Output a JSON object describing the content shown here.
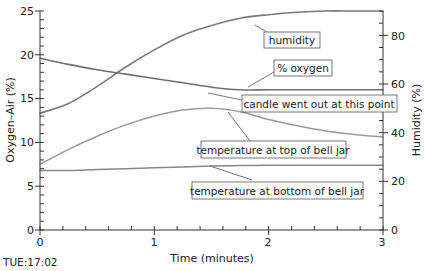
{
  "chart_data": {
    "type": "line",
    "title": "",
    "xlabel": "Time (minutes)",
    "ylabel": "Oxygen–Air (%)",
    "y2label": "Humidity (%)",
    "xlim": [
      0,
      3
    ],
    "ylim": [
      0,
      25
    ],
    "y2lim": [
      0,
      90
    ],
    "x_ticks": [
      "0",
      "1",
      "2",
      "3"
    ],
    "y_ticks": [
      "0",
      "5",
      "10",
      "15",
      "20",
      "25"
    ],
    "y2_ticks": [
      "0",
      "20",
      "40",
      "60",
      "80"
    ],
    "grid": false,
    "legend": "none (inline callout annotations)",
    "x": [
      0,
      0.25,
      0.5,
      0.75,
      1.0,
      1.25,
      1.5,
      1.75,
      2.0,
      2.25,
      2.5,
      2.75,
      3.0
    ],
    "series": [
      {
        "name": "humidity",
        "axis": "right",
        "values": [
          48,
          52,
          59,
          67,
          74,
          80,
          84,
          87,
          88.5,
          89.5,
          90,
          90,
          90
        ]
      },
      {
        "name": "% oxygen",
        "axis": "left",
        "values": [
          19.6,
          18.9,
          18.3,
          17.8,
          17.3,
          16.8,
          16.3,
          16.0,
          16.0,
          16.0,
          16.0,
          16.0,
          16.0
        ]
      },
      {
        "name": "temperature at top of bell jar",
        "axis": "left",
        "values": [
          7.5,
          9.2,
          10.7,
          12.0,
          13.0,
          13.7,
          13.9,
          13.5,
          12.6,
          11.9,
          11.3,
          10.9,
          10.6
        ]
      },
      {
        "name": "temperature at bottom of bell jar",
        "axis": "left",
        "values": [
          6.8,
          6.8,
          6.9,
          7.0,
          7.1,
          7.2,
          7.3,
          7.35,
          7.4,
          7.4,
          7.4,
          7.4,
          7.4
        ]
      }
    ],
    "annotations": [
      "humidity",
      "% oxygen",
      "candle went out at this point",
      "temperature at top of bell jar",
      "temperature at bottom of bell jar"
    ]
  },
  "labels": {
    "xlabel": "Time (minutes)",
    "ylabel": "Oxygen–Air (%)",
    "y2label": "Humidity (%)",
    "footer": "TUE:17:02",
    "annot_humidity": "humidity",
    "annot_oxygen": "% oxygen",
    "annot_candle": "candle went out at this point",
    "annot_temp_top": "temperature at top of bell jar",
    "annot_temp_bottom": "temperature at bottom of bell jar"
  },
  "colors": {
    "line": "#777777",
    "axis": "#333333"
  }
}
